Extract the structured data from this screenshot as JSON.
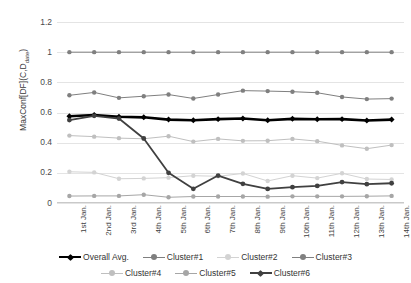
{
  "chart_data": {
    "type": "line",
    "title": "",
    "xlabel": "",
    "ylabel": "MaxConf[DF](C,D_date)",
    "ylabel_main": "MaxConf[DF](C,D",
    "ylabel_sub": "date",
    "ylabel_tail": ")",
    "ylim": [
      0,
      1.2
    ],
    "yticks": [
      "0",
      "0.2",
      "0.4",
      "0.6",
      "0.8",
      "1",
      "1.2"
    ],
    "ytick_values": [
      0,
      0.2,
      0.4,
      0.6,
      0.8,
      1,
      1.2
    ],
    "grid": true,
    "legend_position": "bottom",
    "categories": [
      "1st Jan.",
      "2nd Jan.",
      "3rd Jan.",
      "4th Jan.",
      "5th Jan.",
      "6th Jan.",
      "7th Jan.",
      "8th Jan.",
      "9th Jan.",
      "10th Jan.",
      "11th Jan.",
      "12th Jan.",
      "13th Jan.",
      "14th Jan."
    ],
    "series": [
      {
        "name": "Overall Avg.",
        "color": "#000000",
        "width": 2.6,
        "marker": "diamond",
        "values": [
          0.575,
          0.583,
          0.572,
          0.568,
          0.553,
          0.549,
          0.556,
          0.56,
          0.549,
          0.558,
          0.555,
          0.556,
          0.547,
          0.553
        ]
      },
      {
        "name": "Cluster#1",
        "color": "#7f7f7f",
        "width": 1,
        "marker": "circle",
        "values": [
          0.714,
          0.733,
          0.697,
          0.708,
          0.719,
          0.693,
          0.719,
          0.745,
          0.742,
          0.738,
          0.731,
          0.703,
          0.689,
          0.692
        ]
      },
      {
        "name": "Cluster#2",
        "color": "#d3d3d3",
        "width": 1,
        "marker": "circle",
        "values": [
          0.207,
          0.203,
          0.161,
          0.163,
          0.168,
          0.181,
          0.177,
          0.196,
          0.146,
          0.181,
          0.165,
          0.197,
          0.159,
          0.156
        ]
      },
      {
        "name": "Cluster#3",
        "color": "#808080",
        "width": 1,
        "marker": "circle",
        "values": [
          1.0,
          1.0,
          1.0,
          1.0,
          1.0,
          1.0,
          1.0,
          1.0,
          1.0,
          1.0,
          1.0,
          1.0,
          1.0,
          1.0
        ]
      },
      {
        "name": "Cluster#4",
        "color": "#bfbfbf",
        "width": 1,
        "marker": "circle",
        "values": [
          0.447,
          0.44,
          0.43,
          0.426,
          0.443,
          0.407,
          0.425,
          0.412,
          0.413,
          0.425,
          0.41,
          0.382,
          0.36,
          0.384
        ]
      },
      {
        "name": "Cluster#5",
        "color": "#a6a6a6",
        "width": 1,
        "marker": "circle",
        "values": [
          0.046,
          0.047,
          0.047,
          0.055,
          0.038,
          0.043,
          0.043,
          0.043,
          0.042,
          0.044,
          0.044,
          0.044,
          0.045,
          0.047
        ]
      },
      {
        "name": "Cluster#6",
        "color": "#404040",
        "width": 1.8,
        "marker": "circle",
        "values": [
          0.55,
          0.578,
          0.56,
          0.428,
          0.2,
          0.094,
          0.182,
          0.127,
          0.093,
          0.105,
          0.113,
          0.139,
          0.125,
          0.131
        ]
      }
    ]
  }
}
